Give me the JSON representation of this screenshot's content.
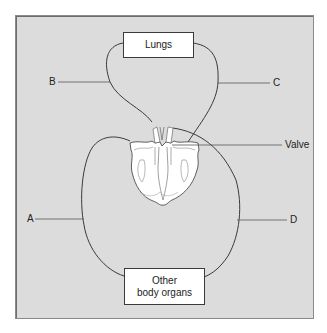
{
  "diagram": {
    "title": "",
    "boxes": {
      "lungs": "Lungs",
      "organs_line1": "Other",
      "organs_line2": "body organs"
    },
    "labels": {
      "a": "A",
      "b": "B",
      "c": "C",
      "d": "D",
      "valve": "Valve"
    },
    "colors": {
      "background": "#dcdcdc",
      "line": "#3a3a3a",
      "heart_fill": "#ffffff"
    }
  }
}
